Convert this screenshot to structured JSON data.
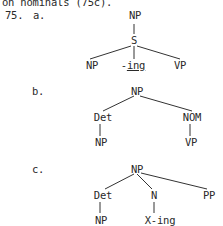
{
  "intro_line": "on nominals (75c).",
  "example_number": "75.",
  "trees": [
    {
      "label": "a.",
      "nodes": {
        "root": "NP",
        "s": "S",
        "left": "NP",
        "mid": "-ing",
        "right": "VP"
      }
    },
    {
      "label": "b.",
      "nodes": {
        "root": "NP",
        "det": "Det",
        "nom": "NOM",
        "det_child": "NP",
        "nom_child": "VP"
      }
    },
    {
      "label": "c.",
      "nodes": {
        "root": "NP",
        "det": "Det",
        "n": "N",
        "pp": "PP",
        "det_child": "NP",
        "n_child": "X-ing"
      }
    }
  ]
}
